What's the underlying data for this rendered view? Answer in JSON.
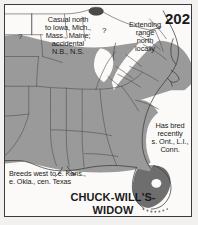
{
  "figure": {
    "name": "chuck-wills-widow-range-map",
    "plate_number": "202",
    "species_name": "CHUCK-WILL'S-\nWIDOW",
    "background_color": "#fbfaf8",
    "frame_color": "#3b3b3b"
  },
  "labels": {
    "casual_north": "Casual north\nto Iowa, Mich.,\nMass., Maine;\naccidental\nN.B., N.S.",
    "extending_range": "Extending\nrange\nnorth\nlocally",
    "has_bred": "Has bred\nrecently\ns. Ont., L.I.,\nConn.",
    "breeds_west": "Breeds west to e. Kans.,\n   e. Okla., cen. Texas",
    "question_mark_west": "?",
    "question_mark_central": "?"
  },
  "legend_colors": {
    "breeding_range": "#9a9a9a",
    "dense_range": "#6e6e6e",
    "out_of_range": "#fbfaf8",
    "water": "#4a4a4a",
    "boundary_line": "#4f4f4f",
    "coastline": "#3a3a3a"
  },
  "map_regions": [
    {
      "name": "main-breeding-range",
      "shade": "breeding_range",
      "description": "southeastern United States"
    },
    {
      "name": "peninsular-florida-dense-range",
      "shade": "dense_range",
      "description": "Florida peninsula"
    },
    {
      "name": "appalachian-extension-wedge",
      "shade": "out_of_range",
      "description": "white wedge northward through Appalachians"
    },
    {
      "name": "lake-okeechobee",
      "shade": "out_of_range",
      "description": "white lake oval in south Florida"
    },
    {
      "name": "great-lakes-water",
      "shade": "water",
      "description": "dark lake at top of map"
    },
    {
      "name": "florida-keys",
      "shade": "dense_range",
      "description": "dotted island chain south of Florida"
    }
  ]
}
